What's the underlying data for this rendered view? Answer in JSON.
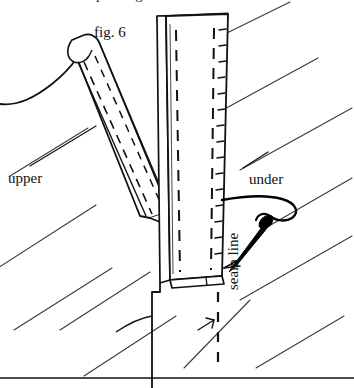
{
  "figure": {
    "caption_label": "fig. 6",
    "labels": {
      "upper": "upper",
      "under": "under",
      "seam_line": "seam line"
    },
    "clipped_top_text": "p g",
    "colors": {
      "ink": "#111111",
      "paper": "#ffffff",
      "hatch": "#3a3a3a",
      "needle": "#000000"
    },
    "parts": [
      {
        "name": "upper-strip",
        "label": "upper",
        "description": "folded binding strip angled from lower right to upper left with fold crease and dashed stitch lines"
      },
      {
        "name": "under-strip",
        "label": "under",
        "description": "vertical binding strip with two dashed stitch lines and small stitch ticks along right edge"
      },
      {
        "name": "seam-line",
        "label": "seam line",
        "description": "vertical dashed guide line below the under strip"
      },
      {
        "name": "needle-and-thread",
        "label": "",
        "description": "sewing needle with thread loop passing through the under strip"
      },
      {
        "name": "background-hatching",
        "label": "",
        "description": "diagonal parallel hatch strokes indicating fabric ground"
      }
    ],
    "bottom_rule": true
  }
}
